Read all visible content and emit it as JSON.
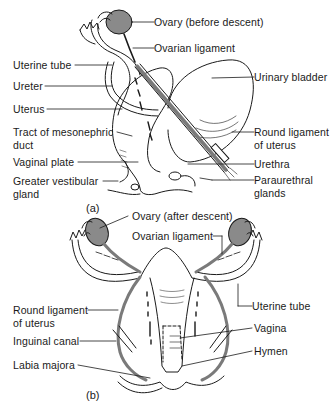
{
  "figure": {
    "panel_a": {
      "caption": "(a)",
      "labels": {
        "ovary": "Ovary (before descent)",
        "ovarian_ligament": "Ovarian ligament",
        "uterine_tube": "Uterine tube",
        "ureter": "Ureter",
        "uterus": "Uterus",
        "mesonephric_1": "Tract of mesonephric",
        "mesonephric_2": "duct",
        "urinary_bladder": "Urinary bladder",
        "round_ligament_1": "Round ligament",
        "round_ligament_2": "of uterus",
        "vaginal_plate": "Vaginal plate",
        "urethra": "Urethra",
        "greater_vestibular_1": "Greater vestibular",
        "greater_vestibular_2": "gland",
        "paraurethral_1": "Paraurethral",
        "paraurethral_2": "glands"
      }
    },
    "panel_b": {
      "caption": "(b)",
      "labels": {
        "ovary": "Ovary (after descent)",
        "ovarian_ligament": "Ovarian ligament",
        "round_ligament_1": "Round ligament",
        "round_ligament_2": "of uterus",
        "uterine_tube": "Uterine tube",
        "inguinal_canal": "Inguinal canal",
        "vagina": "Vagina",
        "hymen": "Hymen",
        "labia_majora": "Labia majora"
      }
    },
    "colors": {
      "ink": "#1a1a1a",
      "ovary_fill": "#8a8a8a",
      "ligament_fill": "#7a7a7a",
      "background": "#ffffff"
    }
  }
}
